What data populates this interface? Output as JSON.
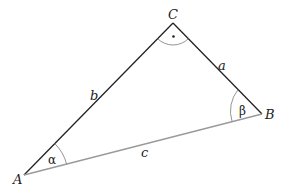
{
  "diagram": {
    "type": "right-triangle",
    "vertices": {
      "A": {
        "label": "A",
        "x": 24,
        "y": 175
      },
      "B": {
        "label": "B",
        "x": 262,
        "y": 114
      },
      "C": {
        "label": "C",
        "x": 173,
        "y": 23
      }
    },
    "sides": {
      "a": {
        "label": "a",
        "from": "C",
        "to": "B",
        "color": "#222222"
      },
      "b": {
        "label": "b",
        "from": "A",
        "to": "C",
        "color": "#222222"
      },
      "c": {
        "label": "c",
        "from": "A",
        "to": "B",
        "color": "#9a9a9a"
      }
    },
    "angles": {
      "alpha": {
        "label": "α",
        "vertex": "A"
      },
      "beta": {
        "label": "β",
        "vertex": "B"
      },
      "gamma": {
        "label": "·",
        "vertex": "C",
        "right_angle": true
      }
    }
  }
}
